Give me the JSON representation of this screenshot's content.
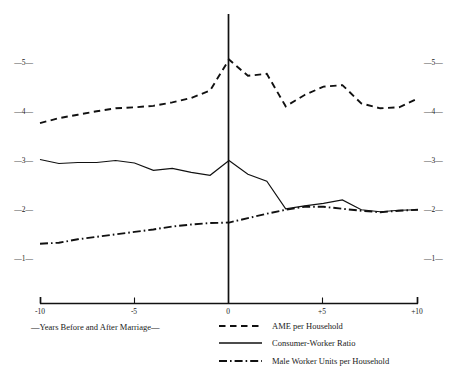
{
  "chart_data": {
    "type": "line",
    "title": "",
    "xlabel": "—Years Before and After Marriage—",
    "ylabel": "",
    "xlim": [
      -10,
      10
    ],
    "ylim": [
      0.5,
      5.45
    ],
    "grid": false,
    "legend_position": "below-right",
    "x_tick_labels": [
      "-10",
      "-5",
      "0",
      "+5",
      "+10"
    ],
    "x_tick_values": [
      -10,
      -5,
      0,
      5,
      10
    ],
    "y_tick_labels": [
      "—5—",
      "—4—",
      "—3—",
      "—2—",
      "—1—"
    ],
    "y_tick_values": [
      5,
      4,
      3,
      2,
      1
    ],
    "y_axis_duplicated_right": true,
    "marriage_marker": "vertical line at year 0",
    "x": [
      -10,
      -9,
      -8,
      -7,
      -6,
      -5,
      -4,
      -3,
      -2,
      -1,
      0,
      1,
      2,
      3,
      4,
      5,
      6,
      7,
      8,
      9,
      10
    ],
    "series": [
      {
        "name": "AME per Household",
        "style": "dashed",
        "values": [
          3.76,
          3.86,
          3.93,
          4.0,
          4.06,
          4.08,
          4.11,
          4.18,
          4.27,
          4.42,
          5.05,
          4.72,
          4.76,
          4.1,
          4.33,
          4.5,
          4.53,
          4.16,
          4.06,
          4.08,
          4.26
        ]
      },
      {
        "name": "Consumer-Worker Ratio",
        "style": "solid",
        "values": [
          3.02,
          2.94,
          2.96,
          2.96,
          3.0,
          2.95,
          2.8,
          2.84,
          2.76,
          2.7,
          3.0,
          2.72,
          2.58,
          2.02,
          2.08,
          2.13,
          2.2,
          2.0,
          1.96,
          1.99,
          2.0
        ]
      },
      {
        "name": "Male Worker Units per Household",
        "style": "dash-dot",
        "values": [
          1.31,
          1.33,
          1.4,
          1.45,
          1.5,
          1.55,
          1.6,
          1.66,
          1.7,
          1.73,
          1.74,
          1.83,
          1.92,
          2.0,
          2.06,
          2.06,
          2.02,
          1.98,
          1.95,
          1.98,
          2.0
        ]
      }
    ]
  },
  "legend": [
    {
      "label": "AME per Household",
      "swatch": "dashed-swatch"
    },
    {
      "label": "Consumer-Worker Ratio",
      "swatch": "solid-swatch"
    },
    {
      "label": "Male Worker Units per Household",
      "swatch": "dash-dot-swatch"
    }
  ],
  "colors": {
    "ink": "#111111",
    "background": "#ffffff"
  }
}
